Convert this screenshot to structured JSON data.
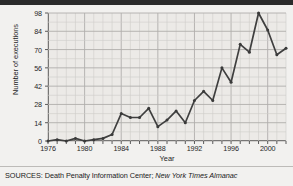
{
  "figure": {
    "ytitle": "Number of executions",
    "xtitle": "Year",
    "sources_prefix": "SOURCES: Death Penalty Information Center; ",
    "sources_italic": "New York Times Almanac",
    "line_color": "#3f3f3f",
    "grid_color": "#b0aeab",
    "minor_grid_color": "#cfcdc9",
    "axis_color": "#4a4a4a",
    "plot_bg": "#eceae7",
    "page_bg": "#f2f1ef"
  },
  "chart_data": {
    "type": "line",
    "title": "",
    "xlabel": "Year",
    "ylabel": "Number of executions",
    "xlim": [
      1976,
      2002
    ],
    "ylim": [
      0,
      98
    ],
    "yticks": [
      0,
      14,
      28,
      42,
      56,
      70,
      84,
      98
    ],
    "xticks": [
      1976,
      1980,
      1984,
      1988,
      1992,
      1996,
      2000
    ],
    "xtick_minor_step": 1,
    "grid": true,
    "legend": "none",
    "markers": true,
    "x": [
      1976,
      1977,
      1978,
      1979,
      1980,
      1981,
      1982,
      1983,
      1984,
      1985,
      1986,
      1987,
      1988,
      1989,
      1990,
      1991,
      1992,
      1993,
      1994,
      1995,
      1996,
      1997,
      1998,
      1999,
      2000,
      2001,
      2002
    ],
    "values": [
      0,
      1,
      0,
      2,
      0,
      1,
      2,
      5,
      21,
      18,
      18,
      25,
      11,
      16,
      23,
      14,
      31,
      38,
      31,
      56,
      45,
      74,
      68,
      98,
      85,
      66,
      71
    ],
    "series": [
      {
        "name": "Number of executions",
        "values": [
          0,
          1,
          0,
          2,
          0,
          1,
          2,
          5,
          21,
          18,
          18,
          25,
          11,
          16,
          23,
          14,
          31,
          38,
          31,
          56,
          45,
          74,
          68,
          98,
          85,
          66,
          71
        ]
      }
    ]
  }
}
